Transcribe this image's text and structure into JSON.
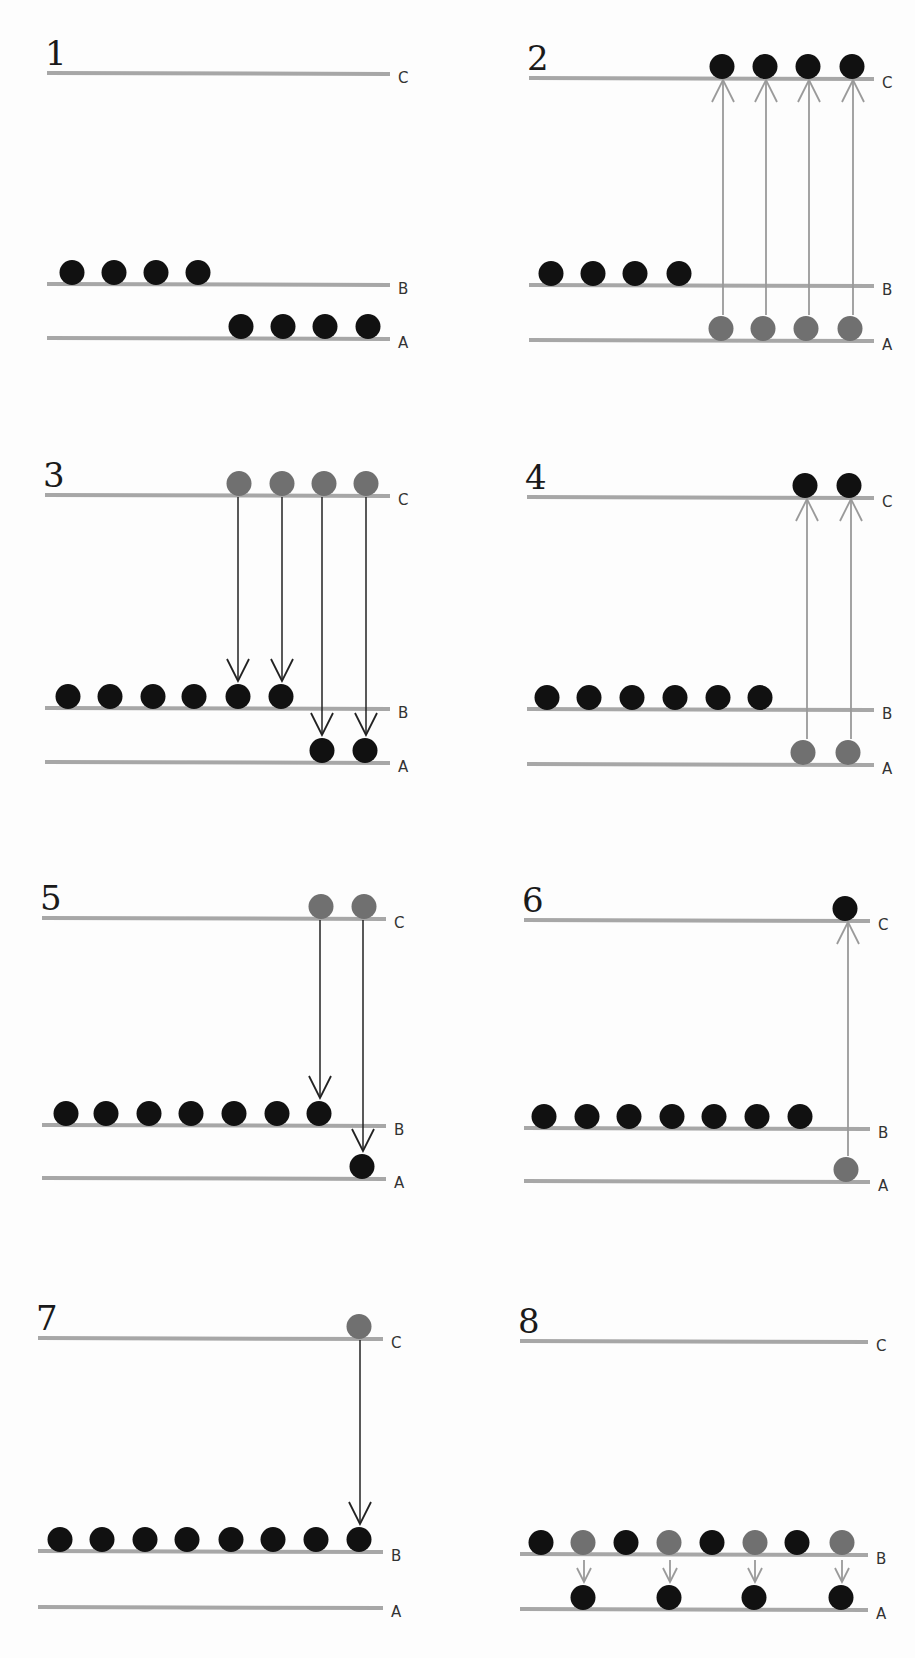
{
  "colors": {
    "level_line": "#a7a7a7",
    "ball_black": "#111111",
    "ball_gray": "#707070",
    "arrow_pump": "#9a9a9a",
    "arrow_decay": "#222222"
  },
  "level_labels": [
    "A",
    "B",
    "C"
  ],
  "panels": [
    {
      "number": "1",
      "ox": 0,
      "oy": 0,
      "lines": {
        "x1": 47,
        "x2": 390,
        "C": 73,
        "B": 284,
        "A": 338
      },
      "balls": [
        {
          "x": 72,
          "level": "B",
          "color": "black"
        },
        {
          "x": 114,
          "level": "B",
          "color": "black"
        },
        {
          "x": 156,
          "level": "B",
          "color": "black"
        },
        {
          "x": 198,
          "level": "B",
          "color": "black"
        },
        {
          "x": 241,
          "level": "A",
          "color": "black"
        },
        {
          "x": 283,
          "level": "A",
          "color": "black"
        },
        {
          "x": 325,
          "level": "A",
          "color": "black"
        },
        {
          "x": 368,
          "level": "A",
          "color": "black"
        }
      ],
      "arrows": []
    },
    {
      "number": "2",
      "ox": 457,
      "oy": 0,
      "lines": {
        "x1": 72,
        "x2": 417,
        "C": 78,
        "B": 285,
        "A": 340
      },
      "balls": [
        {
          "x": 94,
          "level": "B",
          "color": "black"
        },
        {
          "x": 136,
          "level": "B",
          "color": "black"
        },
        {
          "x": 178,
          "level": "B",
          "color": "black"
        },
        {
          "x": 222,
          "level": "B",
          "color": "black"
        },
        {
          "x": 265,
          "level": "C",
          "color": "black"
        },
        {
          "x": 308,
          "level": "C",
          "color": "black"
        },
        {
          "x": 351,
          "level": "C",
          "color": "black"
        },
        {
          "x": 395,
          "level": "C",
          "color": "black"
        },
        {
          "x": 264,
          "level": "A",
          "color": "gray"
        },
        {
          "x": 306,
          "level": "A",
          "color": "gray"
        },
        {
          "x": 349,
          "level": "A",
          "color": "gray"
        },
        {
          "x": 393,
          "level": "A",
          "color": "gray"
        }
      ],
      "arrows": [
        {
          "x": 266,
          "from": "A",
          "to": "C",
          "kind": "pump"
        },
        {
          "x": 309,
          "from": "A",
          "to": "C",
          "kind": "pump"
        },
        {
          "x": 352,
          "from": "A",
          "to": "C",
          "kind": "pump"
        },
        {
          "x": 396,
          "from": "A",
          "to": "C",
          "kind": "pump"
        }
      ]
    },
    {
      "number": "3",
      "ox": 0,
      "oy": 420,
      "lines": {
        "x1": 45,
        "x2": 390,
        "C": 75,
        "B": 288,
        "A": 342
      },
      "balls": [
        {
          "x": 68,
          "level": "B",
          "color": "black"
        },
        {
          "x": 110,
          "level": "B",
          "color": "black"
        },
        {
          "x": 153,
          "level": "B",
          "color": "black"
        },
        {
          "x": 194,
          "level": "B",
          "color": "black"
        },
        {
          "x": 238,
          "level": "B",
          "color": "black"
        },
        {
          "x": 281,
          "level": "B",
          "color": "black"
        },
        {
          "x": 322,
          "level": "A",
          "color": "black"
        },
        {
          "x": 365,
          "level": "A",
          "color": "black"
        },
        {
          "x": 239,
          "level": "C",
          "color": "gray"
        },
        {
          "x": 282,
          "level": "C",
          "color": "gray"
        },
        {
          "x": 324,
          "level": "C",
          "color": "gray"
        },
        {
          "x": 366,
          "level": "C",
          "color": "gray"
        }
      ],
      "arrows": [
        {
          "x": 238,
          "from": "C",
          "to": "B",
          "kind": "decay"
        },
        {
          "x": 282,
          "from": "C",
          "to": "B",
          "kind": "decay"
        },
        {
          "x": 322,
          "from": "C",
          "to": "A",
          "kind": "decay"
        },
        {
          "x": 366,
          "from": "C",
          "to": "A",
          "kind": "decay"
        }
      ]
    },
    {
      "number": "4",
      "ox": 457,
      "oy": 420,
      "lines": {
        "x1": 70,
        "x2": 417,
        "C": 77,
        "B": 289,
        "A": 344
      },
      "balls": [
        {
          "x": 90,
          "level": "B",
          "color": "black"
        },
        {
          "x": 132,
          "level": "B",
          "color": "black"
        },
        {
          "x": 175,
          "level": "B",
          "color": "black"
        },
        {
          "x": 218,
          "level": "B",
          "color": "black"
        },
        {
          "x": 261,
          "level": "B",
          "color": "black"
        },
        {
          "x": 303,
          "level": "B",
          "color": "black"
        },
        {
          "x": 348,
          "level": "C",
          "color": "black"
        },
        {
          "x": 392,
          "level": "C",
          "color": "black"
        },
        {
          "x": 346,
          "level": "A",
          "color": "gray"
        },
        {
          "x": 391,
          "level": "A",
          "color": "gray"
        }
      ],
      "arrows": [
        {
          "x": 350,
          "from": "A",
          "to": "C",
          "kind": "pump"
        },
        {
          "x": 394,
          "from": "A",
          "to": "C",
          "kind": "pump"
        }
      ]
    },
    {
      "number": "5",
      "ox": 0,
      "oy": 820,
      "lines": {
        "x1": 42,
        "x2": 386,
        "C": 98,
        "B": 305,
        "A": 358
      },
      "balls": [
        {
          "x": 66,
          "level": "B",
          "color": "black"
        },
        {
          "x": 106,
          "level": "B",
          "color": "black"
        },
        {
          "x": 149,
          "level": "B",
          "color": "black"
        },
        {
          "x": 191,
          "level": "B",
          "color": "black"
        },
        {
          "x": 234,
          "level": "B",
          "color": "black"
        },
        {
          "x": 277,
          "level": "B",
          "color": "black"
        },
        {
          "x": 319,
          "level": "B",
          "color": "black"
        },
        {
          "x": 362,
          "level": "A",
          "color": "black"
        },
        {
          "x": 321,
          "level": "C",
          "color": "gray"
        },
        {
          "x": 364,
          "level": "C",
          "color": "gray"
        }
      ],
      "arrows": [
        {
          "x": 320,
          "from": "C",
          "to": "B",
          "kind": "decay"
        },
        {
          "x": 363,
          "from": "C",
          "to": "A",
          "kind": "decay"
        }
      ]
    },
    {
      "number": "6",
      "ox": 457,
      "oy": 820,
      "lines": {
        "x1": 67,
        "x2": 413,
        "C": 100,
        "B": 308,
        "A": 361
      },
      "balls": [
        {
          "x": 87,
          "level": "B",
          "color": "black"
        },
        {
          "x": 130,
          "level": "B",
          "color": "black"
        },
        {
          "x": 172,
          "level": "B",
          "color": "black"
        },
        {
          "x": 215,
          "level": "B",
          "color": "black"
        },
        {
          "x": 257,
          "level": "B",
          "color": "black"
        },
        {
          "x": 300,
          "level": "B",
          "color": "black"
        },
        {
          "x": 343,
          "level": "B",
          "color": "black"
        },
        {
          "x": 388,
          "level": "C",
          "color": "black"
        },
        {
          "x": 389,
          "level": "A",
          "color": "gray"
        }
      ],
      "arrows": [
        {
          "x": 391,
          "from": "A",
          "to": "C",
          "kind": "pump"
        }
      ]
    },
    {
      "number": "7",
      "ox": 0,
      "oy": 1220,
      "lines": {
        "x1": 38,
        "x2": 383,
        "C": 118,
        "B": 331,
        "A": 387
      },
      "balls": [
        {
          "x": 60,
          "level": "B",
          "color": "black"
        },
        {
          "x": 102,
          "level": "B",
          "color": "black"
        },
        {
          "x": 145,
          "level": "B",
          "color": "black"
        },
        {
          "x": 187,
          "level": "B",
          "color": "black"
        },
        {
          "x": 231,
          "level": "B",
          "color": "black"
        },
        {
          "x": 273,
          "level": "B",
          "color": "black"
        },
        {
          "x": 316,
          "level": "B",
          "color": "black"
        },
        {
          "x": 359,
          "level": "B",
          "color": "black"
        },
        {
          "x": 359,
          "level": "C",
          "color": "gray"
        }
      ],
      "arrows": [
        {
          "x": 360,
          "from": "C",
          "to": "B",
          "kind": "decay"
        }
      ]
    },
    {
      "number": "8",
      "ox": 457,
      "oy": 1220,
      "lines": {
        "x1": 63,
        "x2": 411,
        "C": 121,
        "B": 334,
        "A": 389
      },
      "balls": [
        {
          "x": 84,
          "level": "B",
          "color": "black"
        },
        {
          "x": 126,
          "level": "B",
          "color": "gray"
        },
        {
          "x": 169,
          "level": "B",
          "color": "black"
        },
        {
          "x": 212,
          "level": "B",
          "color": "gray"
        },
        {
          "x": 255,
          "level": "B",
          "color": "black"
        },
        {
          "x": 298,
          "level": "B",
          "color": "gray"
        },
        {
          "x": 340,
          "level": "B",
          "color": "black"
        },
        {
          "x": 385,
          "level": "B",
          "color": "gray"
        },
        {
          "x": 126,
          "level": "A",
          "color": "black"
        },
        {
          "x": 212,
          "level": "A",
          "color": "black"
        },
        {
          "x": 297,
          "level": "A",
          "color": "black"
        },
        {
          "x": 384,
          "level": "A",
          "color": "black"
        }
      ],
      "arrows": [
        {
          "x": 127,
          "from": "B",
          "to": "A",
          "kind": "pump-short"
        },
        {
          "x": 213,
          "from": "B",
          "to": "A",
          "kind": "pump-short"
        },
        {
          "x": 298,
          "from": "B",
          "to": "A",
          "kind": "pump-short"
        },
        {
          "x": 385,
          "from": "B",
          "to": "A",
          "kind": "pump-short"
        }
      ]
    }
  ]
}
